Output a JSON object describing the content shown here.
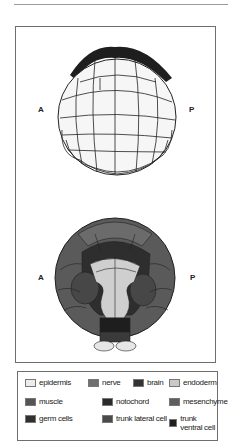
{
  "figure": {
    "top_view": {
      "left_label": "A",
      "right_label": "P"
    },
    "bottom_view": {
      "left_label": "A",
      "right_label": "P"
    }
  },
  "legend": {
    "items": [
      {
        "label": "epidermis",
        "color": "#ececec"
      },
      {
        "label": "nerve",
        "color": "#6f6f6f"
      },
      {
        "label": "brain",
        "color": "#333333"
      },
      {
        "label": "endoderm",
        "color": "#c9c9c9"
      },
      {
        "label": "muscle",
        "color": "#555555"
      },
      {
        "label": "notochord",
        "color": "#2b2b2b"
      },
      {
        "label": "mesenchyme",
        "color": "#5e5e5e"
      },
      {
        "label": "germ cells",
        "color": "#303030"
      },
      {
        "label": "trunk lateral cell",
        "color": "#4a4a4a"
      },
      {
        "label": "trunk ventral cell",
        "color": "#1f1f1f"
      }
    ]
  }
}
